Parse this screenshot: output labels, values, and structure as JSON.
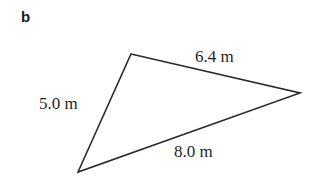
{
  "figure": {
    "part_label": "b",
    "background_color": "#ffffff",
    "stroke_color": "#2b2b2b",
    "text_color": "#1f1f1f",
    "width": 317,
    "height": 188
  },
  "shape": {
    "type": "triangle",
    "vertices": [
      {
        "name": "top-vertex",
        "x": 131,
        "y": 54
      },
      {
        "name": "right-vertex",
        "x": 300,
        "y": 93
      },
      {
        "name": "bottom-left-vertex",
        "x": 78,
        "y": 172
      }
    ],
    "points_attr": "131,54 300,93 78,172"
  },
  "labels": {
    "side_top": "6.4 m",
    "side_left": "5.0 m",
    "side_bottom": "8.0 m"
  },
  "measurements": {
    "unit": "m",
    "sides": [
      {
        "name": "top-right-side",
        "length": 6.4,
        "label": "6.4 m"
      },
      {
        "name": "left-side",
        "length": 5.0,
        "label": "5.0 m"
      },
      {
        "name": "bottom-side",
        "length": 8.0,
        "label": "8.0 m"
      }
    ]
  }
}
